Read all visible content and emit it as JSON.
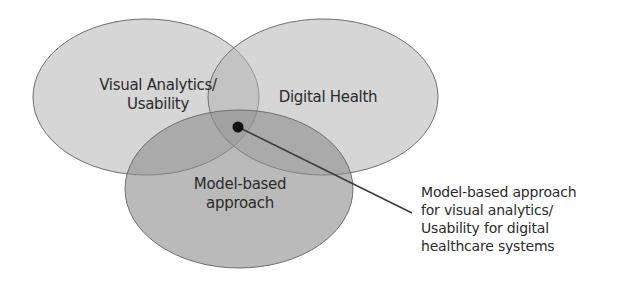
{
  "diagram": {
    "type": "venn",
    "sets": [
      {
        "id": "visual",
        "label_line1": "Visual Analytics/",
        "label_line2": "Usability"
      },
      {
        "id": "health",
        "label_line1": "Digital Health"
      },
      {
        "id": "model",
        "label_line1": "Model-based",
        "label_line2": "approach"
      }
    ],
    "annotation": {
      "lines": [
        "Model-based approach",
        "for visual analytics/",
        "Usability for digital",
        "healthcare systems"
      ]
    },
    "colors": {
      "fill": "#8a8a8a",
      "stroke": "#6a6a6a",
      "dot": "#111111",
      "leader": "#3a3a3a",
      "text": "#2b2b2b"
    }
  }
}
